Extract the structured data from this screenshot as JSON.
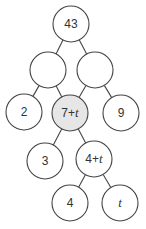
{
  "diagram": {
    "type": "tree",
    "colors": {
      "stroke": "#444444",
      "node_fill": "#ffffff",
      "highlight_fill": "#e6e6e6",
      "text": "#333333"
    },
    "nodes": [
      {
        "id": "root",
        "label": "43",
        "num": "43",
        "var": "",
        "cx": 71,
        "cy": 24,
        "highlight": false
      },
      {
        "id": "left",
        "label": "",
        "num": "",
        "var": "",
        "cx": 48,
        "cy": 70,
        "highlight": false
      },
      {
        "id": "right",
        "label": "",
        "num": "",
        "var": "",
        "cx": 95,
        "cy": 70,
        "highlight": false
      },
      {
        "id": "n2",
        "label": "2",
        "num": "2",
        "var": "",
        "cx": 24,
        "cy": 112,
        "highlight": false
      },
      {
        "id": "n7t",
        "label": "7+t",
        "num": "7+",
        "var": "t",
        "cx": 70,
        "cy": 113,
        "highlight": true
      },
      {
        "id": "n9",
        "label": "9",
        "num": "9",
        "var": "",
        "cx": 121,
        "cy": 113,
        "highlight": false
      },
      {
        "id": "n3",
        "label": "3",
        "num": "3",
        "var": "",
        "cx": 45,
        "cy": 161,
        "highlight": false
      },
      {
        "id": "n4t",
        "label": "4+t",
        "num": "4+",
        "var": "t",
        "cx": 94,
        "cy": 159,
        "highlight": false
      },
      {
        "id": "n4",
        "label": "4",
        "num": "4",
        "var": "",
        "cx": 70,
        "cy": 203,
        "highlight": false
      },
      {
        "id": "nt",
        "label": "t",
        "num": "",
        "var": "t",
        "cx": 120,
        "cy": 203,
        "highlight": false
      }
    ],
    "radius": 18,
    "edges": [
      [
        "root",
        "left"
      ],
      [
        "root",
        "right"
      ],
      [
        "left",
        "n2"
      ],
      [
        "left",
        "n7t"
      ],
      [
        "right",
        "n7t"
      ],
      [
        "right",
        "n9"
      ],
      [
        "n7t",
        "n3"
      ],
      [
        "n7t",
        "n4t"
      ],
      [
        "n4t",
        "n4"
      ],
      [
        "n4t",
        "nt"
      ]
    ]
  }
}
